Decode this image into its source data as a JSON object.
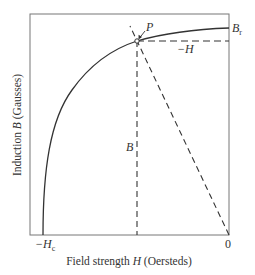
{
  "diagram": {
    "type": "demagnetization-curve",
    "frame": {
      "left": 30,
      "top": 14,
      "right": 229,
      "bottom": 235
    },
    "colors": {
      "line": "#333333",
      "frame": "#777777",
      "background": "#ffffff"
    },
    "x_axis": {
      "label_prefix": "Field strength ",
      "label_var": "H",
      "label_suffix": " (Oersteds)",
      "tick_left_prefix": "−H",
      "tick_left_sub": "c",
      "tick_right": "0"
    },
    "y_axis": {
      "label_prefix": "Induction ",
      "label_var": "B",
      "label_suffix": " (Gausses)"
    },
    "annotations": {
      "point_label": "P",
      "br_label": "B",
      "br_sub": "r",
      "neg_h_label": "−H",
      "b_label": "B"
    }
  }
}
